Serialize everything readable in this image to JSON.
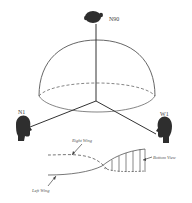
{
  "diagram": {
    "type": "hemisphere-listener-geometry",
    "colors": {
      "background": "#ffffff",
      "line": "#4a4a4a",
      "head": "#2e2e2e",
      "text": "#444444"
    },
    "listeners": [
      {
        "id": "n90",
        "label": "N90",
        "position": "top",
        "icon": "head-silhouette-icon"
      },
      {
        "id": "n1",
        "label": "N1",
        "position": "left",
        "icon": "head-silhouette-icon"
      },
      {
        "id": "w1",
        "label": "W1",
        "position": "right",
        "icon": "head-silhouette-icon"
      }
    ],
    "wing_figure": {
      "labels": {
        "right_wing": "Right Wing",
        "left_wing": "Left Wing",
        "bottom_view": "Bottom View"
      }
    }
  }
}
